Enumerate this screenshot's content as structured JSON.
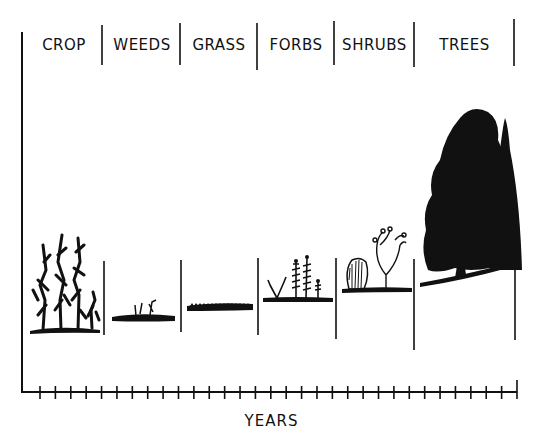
{
  "diagram": {
    "title": "",
    "stages": [
      {
        "label": "CROP",
        "vegetation": "corn stalks"
      },
      {
        "label": "WEEDS",
        "vegetation": "low weeds"
      },
      {
        "label": "GRASS",
        "vegetation": "short grass"
      },
      {
        "label": "FORBS",
        "vegetation": "forbs"
      },
      {
        "label": "SHRUBS",
        "vegetation": "shrubs"
      },
      {
        "label": "TREES",
        "vegetation": "trees"
      }
    ],
    "x_axis_label": "YEARS",
    "tick_count": 32
  },
  "colors": {
    "ink": "#111111",
    "background": "#ffffff"
  }
}
